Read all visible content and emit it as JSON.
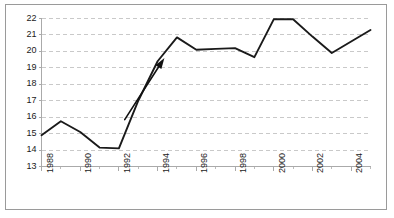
{
  "figure": {
    "frame_color": "#9a9a9a",
    "background": "#ffffff"
  },
  "chart_data": {
    "type": "line",
    "title": "",
    "subtitle": "",
    "xlabel": "",
    "ylabel": "",
    "xlim": [
      1988,
      2005
    ],
    "ylim": [
      13,
      22
    ],
    "yticks": [
      13,
      14,
      15,
      16,
      17,
      18,
      19,
      20,
      21,
      22
    ],
    "ytick_labels": [
      "13",
      "14",
      "15",
      "16",
      "17",
      "18",
      "19",
      "20",
      "21",
      "22"
    ],
    "xticks": [
      1988,
      1990,
      1992,
      1994,
      1996,
      1998,
      2000,
      2002,
      2004
    ],
    "xtick_labels": [
      "1988",
      "1990",
      "1992",
      "1994",
      "1996",
      "1998",
      "2000",
      "2002",
      "2004"
    ],
    "x_minor_ticks": [
      1989,
      1991,
      1993,
      1995,
      1997,
      1999,
      2001,
      2003,
      2005
    ],
    "grid": {
      "horizontal": true,
      "vertical": false,
      "style": "dashed",
      "color": "#c9c9c9"
    },
    "legend": null,
    "series": [
      {
        "name": "series-1",
        "color": "#1a1a1a",
        "line_width": 1.9,
        "x": [
          1988,
          1989,
          1990,
          1991,
          1992,
          1993,
          1994,
          1995,
          1996,
          1997,
          1998,
          1999,
          2000,
          2001,
          2002,
          2003,
          2004,
          2005
        ],
        "values": [
          14.9,
          15.75,
          15.1,
          14.15,
          14.1,
          17.0,
          19.4,
          20.85,
          20.1,
          20.15,
          20.2,
          19.65,
          21.95,
          21.95,
          20.9,
          19.9,
          20.6,
          21.3
        ]
      }
    ],
    "annotations": [
      {
        "type": "arrow",
        "name": "trend-arrow",
        "color": "#111111",
        "x_start": 1992.3,
        "y_start": 15.85,
        "x_end": 1994.35,
        "y_end": 19.6,
        "head_length": 11,
        "head_width": 7
      }
    ]
  }
}
